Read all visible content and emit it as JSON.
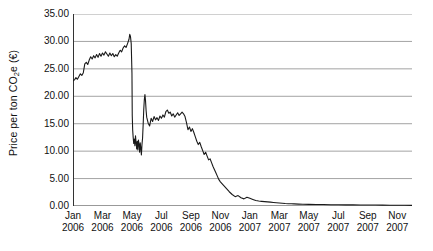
{
  "chart_data": {
    "type": "line",
    "title": "",
    "subtitle": "",
    "xlabel": "",
    "ylabel": "Price per ton CO2e (€)",
    "ylabel_parts": {
      "pre": "Price per ton CO",
      "sub": "2",
      "post": "e (€)"
    },
    "ylim": [
      0,
      35
    ],
    "ytick_step": 5,
    "ytick_labels": [
      "35.00",
      "30.00",
      "25.00",
      "20.00",
      "15.00",
      "10.00",
      "5.00",
      "0.00"
    ],
    "ytick_values": [
      35,
      30,
      25,
      20,
      15,
      10,
      5,
      0
    ],
    "grid": "horizontal",
    "legend": "none",
    "line_color": "#1a1a1a",
    "xtick_labels": [
      {
        "month": "Jan",
        "year": "2006"
      },
      {
        "month": "Mar",
        "year": "2006"
      },
      {
        "month": "May",
        "year": "2006"
      },
      {
        "month": "Jul",
        "year": "2006"
      },
      {
        "month": "Sep",
        "year": "2006"
      },
      {
        "month": "Nov",
        "year": "2006"
      },
      {
        "month": "Jan",
        "year": "2007"
      },
      {
        "month": "Mar",
        "year": "2007"
      },
      {
        "month": "May",
        "year": "2007"
      },
      {
        "month": "Jul",
        "year": "2007"
      },
      {
        "month": "Sep",
        "year": "2007"
      },
      {
        "month": "Nov",
        "year": "2007"
      }
    ],
    "xlim_months": [
      0,
      23
    ],
    "x_unit": "months since Jan 2006",
    "series": [
      {
        "name": "EUA price",
        "x": [
          0.0,
          0.1,
          0.2,
          0.3,
          0.4,
          0.5,
          0.6,
          0.7,
          0.8,
          0.9,
          1.0,
          1.1,
          1.2,
          1.3,
          1.4,
          1.5,
          1.6,
          1.7,
          1.8,
          1.9,
          2.0,
          2.1,
          2.2,
          2.3,
          2.4,
          2.5,
          2.6,
          2.7,
          2.8,
          2.9,
          3.0,
          3.1,
          3.2,
          3.3,
          3.4,
          3.5,
          3.6,
          3.7,
          3.8,
          3.85,
          3.9,
          3.95,
          4.0,
          4.02,
          4.05,
          4.08,
          4.12,
          4.16,
          4.2,
          4.24,
          4.28,
          4.32,
          4.36,
          4.4,
          4.44,
          4.48,
          4.52,
          4.56,
          4.6,
          4.64,
          4.68,
          4.72,
          4.76,
          4.8,
          4.84,
          4.88,
          4.92,
          4.96,
          5.0,
          5.1,
          5.2,
          5.3,
          5.4,
          5.5,
          5.6,
          5.7,
          5.8,
          5.9,
          6.0,
          6.1,
          6.2,
          6.3,
          6.4,
          6.5,
          6.6,
          6.7,
          6.8,
          6.9,
          7.0,
          7.1,
          7.2,
          7.3,
          7.4,
          7.5,
          7.6,
          7.7,
          7.8,
          7.9,
          8.0,
          8.1,
          8.2,
          8.3,
          8.4,
          8.5,
          8.6,
          8.7,
          8.8,
          8.9,
          9.0,
          9.1,
          9.2,
          9.3,
          9.4,
          9.5,
          9.6,
          9.7,
          9.8,
          9.9,
          10.0,
          10.2,
          10.4,
          10.6,
          10.8,
          11.0,
          11.2,
          11.4,
          11.6,
          11.8,
          12.0,
          12.2,
          12.4,
          12.6,
          12.8,
          13.0,
          13.2,
          13.4,
          13.6,
          13.8,
          14.0,
          14.2,
          14.4,
          14.6,
          14.8,
          15.0,
          15.3,
          15.6,
          16.0,
          16.5,
          17.0,
          17.5,
          18.0,
          18.5,
          19.0,
          19.5,
          20.0,
          20.5,
          21.0,
          21.5,
          22.0,
          22.5,
          23.0
        ],
        "y": [
          22.8,
          23.0,
          23.4,
          23.1,
          23.6,
          24.1,
          23.8,
          24.3,
          25.9,
          26.2,
          25.8,
          26.6,
          27.2,
          26.8,
          27.4,
          27.0,
          27.6,
          27.1,
          27.8,
          27.3,
          27.9,
          27.5,
          28.1,
          27.7,
          27.3,
          27.9,
          27.4,
          27.8,
          27.2,
          27.6,
          27.3,
          27.9,
          28.4,
          28.1,
          28.8,
          29.2,
          28.9,
          29.6,
          30.4,
          31.3,
          30.9,
          29.6,
          24.2,
          16.5,
          13.8,
          12.6,
          11.4,
          12.2,
          11.0,
          12.8,
          11.6,
          10.4,
          11.8,
          10.2,
          12.0,
          11.3,
          9.8,
          11.5,
          10.6,
          9.3,
          11.2,
          12.4,
          14.8,
          17.6,
          19.4,
          20.3,
          19.2,
          17.4,
          16.2,
          15.1,
          14.6,
          16.0,
          15.4,
          16.3,
          15.7,
          16.1,
          15.6,
          16.4,
          16.0,
          16.6,
          16.2,
          17.2,
          17.5,
          16.9,
          17.1,
          16.4,
          16.8,
          16.2,
          16.6,
          17.0,
          16.5,
          16.8,
          17.1,
          16.8,
          16.3,
          15.2,
          13.9,
          14.4,
          13.6,
          14.1,
          13.4,
          12.6,
          11.8,
          11.2,
          11.6,
          10.8,
          10.1,
          9.4,
          9.8,
          9.1,
          8.4,
          8.6,
          7.9,
          7.2,
          6.6,
          6.0,
          5.4,
          4.8,
          4.4,
          3.8,
          3.2,
          2.6,
          2.1,
          1.7,
          1.9,
          1.5,
          1.3,
          1.6,
          1.4,
          1.2,
          1.0,
          0.9,
          0.85,
          0.8,
          0.75,
          0.7,
          0.65,
          0.6,
          0.55,
          0.5,
          0.45,
          0.42,
          0.4,
          0.38,
          0.35,
          0.32,
          0.3,
          0.28,
          0.26,
          0.24,
          0.22,
          0.21,
          0.2,
          0.19,
          0.18,
          0.17,
          0.16,
          0.15,
          0.14,
          0.13,
          0.12
        ]
      }
    ]
  }
}
